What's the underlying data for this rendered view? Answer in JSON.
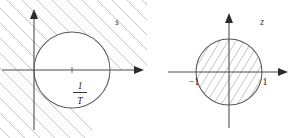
{
  "figure": {
    "width": 297,
    "height": 138,
    "background": "#ffffff",
    "line_color": "#4d4d4d",
    "hatch_color": "#b9b9b9",
    "curve_color": "#5a5a5a",
    "text_color": "#1f1f1f"
  },
  "panels": [
    {
      "id": "s-plane",
      "plane_label": "s",
      "axes": {
        "origin_x": 34,
        "origin_y": 70,
        "x_axis_label": "",
        "y_axis_label": "",
        "x_arrow": "right-arrow",
        "y_arrow": "up-arrow"
      },
      "circle": {
        "center_x": 72,
        "center_y": 70,
        "radius": 38,
        "passes_through_origin": true,
        "filled": false
      },
      "hatching": {
        "region": "exterior",
        "direction": "descending",
        "spacing": 15
      },
      "tick": {
        "x": 72,
        "label_numerator": "1",
        "label_denominator": "T"
      }
    },
    {
      "id": "z-plane",
      "plane_label": "z",
      "axes": {
        "origin_x": 229,
        "origin_y": 72,
        "x_axis_label": "",
        "y_axis_label": "",
        "x_arrow": "right-arrow",
        "y_arrow": "up-arrow"
      },
      "circle": {
        "center_x": 229,
        "center_y": 72,
        "radius": 33,
        "passes_through_origin": false,
        "filled": true
      },
      "hatching": {
        "region": "interior",
        "direction": "ascending",
        "spacing": 8
      },
      "ticks": [
        {
          "x": 196,
          "label": "−1"
        },
        {
          "x": 262,
          "label": "1"
        }
      ]
    }
  ]
}
